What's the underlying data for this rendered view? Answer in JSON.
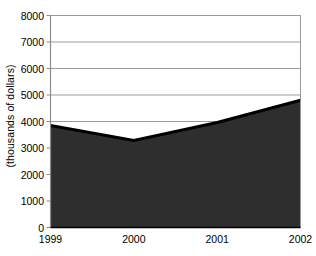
{
  "chart_data": {
    "type": "area",
    "title": "",
    "subtitle": "",
    "xlabel": "",
    "ylabel": "(thousands of dollars)",
    "categories": [
      "1999",
      "2000",
      "2001",
      "2002"
    ],
    "x": [
      1999,
      2000,
      2001,
      2002
    ],
    "values": [
      3850,
      3280,
      3960,
      4800
    ],
    "series": [
      {
        "name": "",
        "values": [
          3850,
          3280,
          3960,
          4800
        ]
      }
    ],
    "ylim": [
      0,
      8000
    ],
    "ytick_labels": [
      "0",
      "1000",
      "2000",
      "3000",
      "4000",
      "5000",
      "6000",
      "7000",
      "8000"
    ],
    "ytick_values": [
      0,
      1000,
      2000,
      3000,
      4000,
      5000,
      6000,
      7000,
      8000
    ],
    "xtick_labels": [
      "1999",
      "2000",
      "2001",
      "2002"
    ],
    "grid": "horizontal",
    "legend": "none",
    "annotations": [],
    "colors": {
      "area_fill": "#2e2e2e",
      "area_stroke": "#000000",
      "gridline": "#9a9a9a",
      "axis": "#8c8c8c",
      "background": "#ffffff",
      "text": "#000000"
    }
  }
}
